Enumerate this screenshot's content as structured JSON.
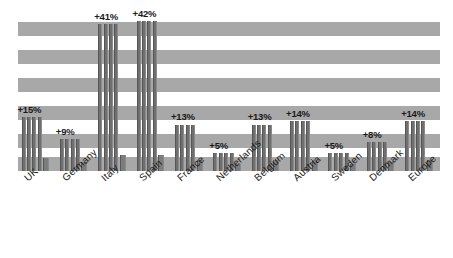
{
  "chart_data": {
    "type": "bar",
    "title": "",
    "subtitle": "",
    "xlabel": "",
    "ylabel": "",
    "grid": "horizontal-banded",
    "legend": "none",
    "ylim": [
      0,
      45
    ],
    "categories": [
      "UK",
      "Germany",
      "Italy",
      "Spain",
      "France",
      "Netherlands",
      "Belgium",
      "Austria",
      "Sweden",
      "Denmark",
      "Europe"
    ],
    "data_labels": [
      "+15%",
      "+9%",
      "+41%",
      "+42%",
      "+13%",
      "+5%",
      "+13%",
      "+14%",
      "+5%",
      "+8%",
      "+14%"
    ],
    "values": [
      15,
      9,
      41,
      42,
      13,
      5,
      13,
      14,
      5,
      8,
      14
    ],
    "bars_per_group": 5,
    "series": [
      {
        "name": "bar-1",
        "values": [
          15,
          9,
          41,
          42,
          13,
          5,
          13,
          14,
          5,
          8,
          14
        ]
      },
      {
        "name": "bar-2",
        "values": [
          15,
          9,
          41,
          42,
          13,
          5,
          13,
          14,
          5,
          8,
          14
        ]
      },
      {
        "name": "bar-3",
        "values": [
          15,
          9,
          41,
          42,
          13,
          5,
          13,
          14,
          5,
          8,
          14
        ]
      },
      {
        "name": "bar-4",
        "values": [
          15,
          9,
          41,
          42,
          13,
          5,
          13,
          14,
          5,
          8,
          14
        ]
      },
      {
        "name": "bar-marker",
        "values": [
          3.5,
          2.5,
          4.5,
          4.5,
          3.0,
          2.0,
          3.0,
          3.2,
          2.0,
          2.5,
          3.2
        ]
      }
    ],
    "colors": {
      "bar": "#6f6f6f",
      "band": "#a8a8a8",
      "background": "#ffffff",
      "label_text": "#1a1a1a"
    }
  },
  "bands": [
    {
      "top": 12,
      "height": 14
    },
    {
      "top": 40,
      "height": 14
    },
    {
      "top": 68,
      "height": 14
    },
    {
      "top": 96,
      "height": 14
    },
    {
      "top": 124,
      "height": 14
    },
    {
      "top": 147,
      "height": 14
    }
  ]
}
